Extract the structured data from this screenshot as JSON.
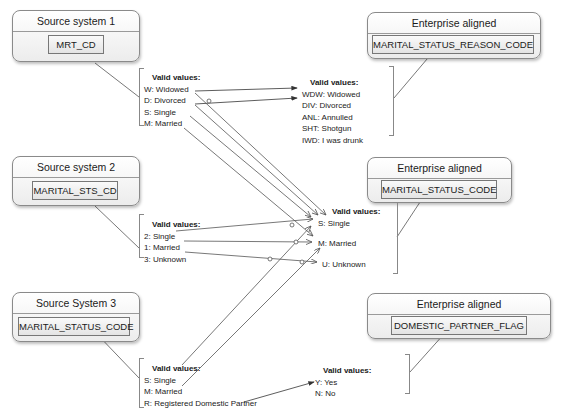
{
  "sources": [
    {
      "title": "Source system 1",
      "field": "MRT_CD",
      "valid_values_label": "Valid values:",
      "values": [
        "W: Widowed",
        "D: Divorced",
        "S: Single",
        "M: Married"
      ]
    },
    {
      "title": "Source system 2",
      "field": "MARITAL_STS_CD",
      "valid_values_label": "Valid values:",
      "values": [
        "2: Single",
        "1: Married",
        "3: Unknown"
      ]
    },
    {
      "title": "Source System 3",
      "field": "MARITAL_STATUS_CODE",
      "valid_values_label": "Valid values:",
      "values": [
        "S: Single",
        "M: Married",
        "R: Registered Domestic Partner"
      ]
    }
  ],
  "targets": [
    {
      "title": "Enterprise aligned",
      "field": "MARITAL_STATUS_REASON_CODE",
      "valid_values_label": "Valid values:",
      "values": [
        "WDW: Widowed",
        "DIV: Divorced",
        "ANL: Annulled",
        "SHT: Shotgun",
        "IWD: I was drunk"
      ]
    },
    {
      "title": "Enterprise aligned",
      "field": "MARITAL_STATUS_CODE",
      "valid_values_label": "Valid values:",
      "values": [
        "S: Single",
        "M: Married",
        "U: Unknown"
      ]
    },
    {
      "title": "Enterprise aligned",
      "field": "DOMESTIC_PARTNER_FLAG",
      "valid_values_label": "Valid values:",
      "values": [
        "Y: Yes",
        "N: No"
      ]
    }
  ],
  "mappings": [
    {
      "from": "W: Widowed",
      "to": "WDW: Widowed"
    },
    {
      "from": "D: Divorced",
      "to": "DIV: Divorced"
    },
    {
      "from": "W: Widowed",
      "to": "S: Single"
    },
    {
      "from": "D: Divorced",
      "to": "S: Single"
    },
    {
      "from": "S: Single",
      "to": "S: Single"
    },
    {
      "from": "M: Married",
      "to": "M: Married"
    },
    {
      "from": "2: Single",
      "to": "S: Single"
    },
    {
      "from": "1: Married",
      "to": "M: Married"
    },
    {
      "from": "3: Unknown",
      "to": "U: Unknown"
    },
    {
      "from": "S: Single (Source System 3)",
      "to": "S: Single"
    },
    {
      "from": "M: Married (Source System 3)",
      "to": "M: Married"
    },
    {
      "from": "R: Registered Domestic Partner",
      "to": "Y: Yes"
    }
  ],
  "colors": {
    "line": "#555555",
    "border": "#8a8a8a"
  }
}
